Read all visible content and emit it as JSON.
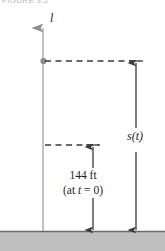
{
  "figure": {
    "caption": "FIGURE 3.2",
    "axis_label": "l",
    "height_label_value": "144 ft",
    "height_label_condition_prefix": "(at ",
    "height_label_condition_var": "t",
    "height_label_condition_suffix": " = 0)",
    "distance_label": "s(t)",
    "colors": {
      "ground_fill": "#bfbfbf",
      "ground_line": "#6b6b6b",
      "axis_line": "#a8a8a8",
      "arrow_line": "#3a3a3a",
      "dash_line": "#3a3a3a",
      "point_marker": "#8a8a8a",
      "text": "#1d1d1d",
      "caption_text": "#b9b9b9",
      "background": "#ffffff"
    },
    "geometry": {
      "axis_x": 43,
      "axis_top_y": 16,
      "ground_y": 231,
      "point_y": 61,
      "mid_dash_y": 145,
      "inner_arrow_x": 93,
      "outer_arrow_x": 136,
      "top_dash_x_end": 140,
      "mid_dash_x_end": 99
    }
  }
}
